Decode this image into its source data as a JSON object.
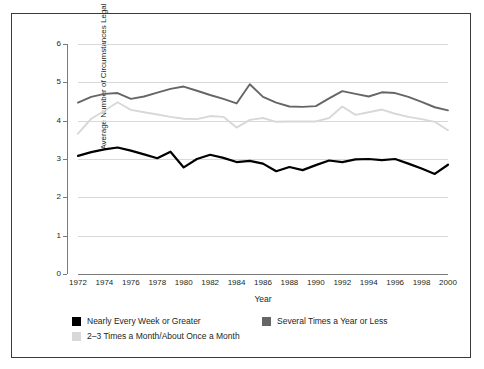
{
  "page_header": {
    "left": "",
    "right": ""
  },
  "chart_data": {
    "type": "line",
    "title": "",
    "xlabel": "Year",
    "ylabel": "Average Number of Circumstances Legal",
    "xlim": [
      1972,
      2000
    ],
    "ylim": [
      0,
      6
    ],
    "yticks": [
      0,
      1,
      2,
      3,
      4,
      5,
      6
    ],
    "xticks": [
      1972,
      1974,
      1976,
      1978,
      1980,
      1982,
      1984,
      1986,
      1988,
      1990,
      1992,
      1994,
      1996,
      1998,
      2000
    ],
    "grid": true,
    "legend_position": "below-axes",
    "x": [
      1972,
      1973,
      1974,
      1975,
      1976,
      1977,
      1978,
      1979,
      1980,
      1981,
      1982,
      1983,
      1984,
      1985,
      1986,
      1987,
      1988,
      1989,
      1990,
      1991,
      1992,
      1993,
      1994,
      1995,
      1996,
      1997,
      1998,
      1999,
      2000
    ],
    "series": [
      {
        "name": "Nearly Every Week or Greater",
        "color": "#000000",
        "values": [
          3.08,
          3.18,
          3.25,
          3.3,
          3.22,
          3.12,
          3.02,
          3.19,
          2.78,
          3.0,
          3.11,
          3.03,
          2.92,
          2.95,
          2.88,
          2.68,
          2.79,
          2.71,
          2.84,
          2.96,
          2.92,
          2.99,
          3.0,
          2.97,
          3.0,
          2.88,
          2.75,
          2.61,
          2.85
        ]
      },
      {
        "name": "Several Times a Year or Less",
        "color": "#666666",
        "values": [
          4.47,
          4.62,
          4.7,
          4.72,
          4.57,
          4.63,
          4.73,
          4.83,
          4.89,
          4.78,
          4.67,
          4.57,
          4.45,
          4.95,
          4.62,
          4.47,
          4.37,
          4.36,
          4.38,
          4.58,
          4.77,
          4.7,
          4.63,
          4.74,
          4.72,
          4.62,
          4.49,
          4.35,
          4.27
        ]
      },
      {
        "name": "2–3 Times a Month/About Once a Month",
        "color": "#d8d8d8",
        "values": [
          3.66,
          4.05,
          4.26,
          4.48,
          4.28,
          4.22,
          4.16,
          4.1,
          4.05,
          4.04,
          4.12,
          4.1,
          3.82,
          4.02,
          4.07,
          3.97,
          3.98,
          3.98,
          3.98,
          4.07,
          4.37,
          4.15,
          4.22,
          4.29,
          4.18,
          4.1,
          4.04,
          3.97,
          3.75
        ]
      }
    ]
  },
  "legend": [
    {
      "label": "Nearly Every Week or Greater",
      "color": "#000000"
    },
    {
      "label": "Several Times a Year or Less",
      "color": "#666666"
    },
    {
      "label": "2–3 Times a Month/About Once a Month",
      "color": "#d8d8d8"
    }
  ]
}
